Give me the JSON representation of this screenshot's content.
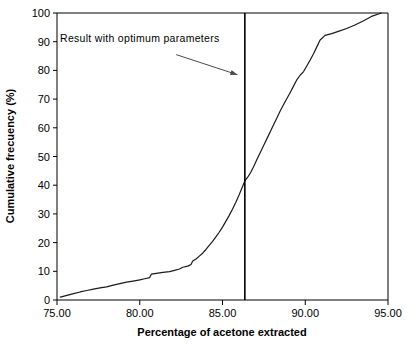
{
  "chart_data": {
    "type": "line",
    "title": "",
    "xlabel": "Percentage of acetone extracted",
    "ylabel": "Cumulative frecuency (%)",
    "xlim": [
      75.0,
      95.0
    ],
    "ylim": [
      0,
      100
    ],
    "xticks": [
      "75.00",
      "80.00",
      "85.00",
      "90.00",
      "95.00"
    ],
    "xtick_values": [
      75,
      80,
      85,
      90,
      95
    ],
    "yticks": [
      "0",
      "10",
      "20",
      "30",
      "40",
      "50",
      "60",
      "70",
      "80",
      "90",
      "100"
    ],
    "ytick_values": [
      0,
      10,
      20,
      30,
      40,
      50,
      60,
      70,
      80,
      90,
      100
    ],
    "grid": false,
    "legend": false,
    "series": [
      {
        "name": "Cumulative frequency curve",
        "x": [
          75.2,
          75.6,
          76.0,
          76.4,
          76.8,
          77.2,
          77.6,
          78.0,
          78.4,
          78.8,
          79.2,
          79.6,
          80.0,
          80.3,
          80.6,
          80.7,
          81.0,
          81.4,
          81.8,
          82.1,
          82.4,
          82.6,
          82.9,
          83.1,
          83.2,
          83.4,
          83.6,
          83.8,
          84.0,
          84.2,
          84.4,
          84.6,
          84.8,
          85.0,
          85.2,
          85.4,
          85.6,
          85.8,
          86.0,
          86.2,
          86.35,
          86.5,
          86.7,
          86.9,
          87.1,
          87.3,
          87.5,
          87.7,
          87.9,
          88.1,
          88.3,
          88.5,
          88.7,
          88.9,
          89.1,
          89.3,
          89.5,
          89.7,
          89.9,
          90.1,
          90.3,
          90.5,
          90.7,
          90.9,
          91.2,
          91.6,
          92.0,
          92.5,
          93.0,
          93.5,
          94.0,
          94.6
        ],
        "y": [
          1.0,
          1.6,
          2.2,
          2.8,
          3.3,
          3.8,
          4.2,
          4.6,
          5.2,
          5.7,
          6.2,
          6.6,
          7.0,
          7.4,
          7.8,
          9.0,
          9.3,
          9.6,
          9.9,
          10.3,
          10.8,
          11.4,
          11.8,
          12.4,
          13.6,
          14.3,
          15.3,
          16.3,
          17.6,
          19.0,
          20.4,
          22.0,
          23.6,
          25.4,
          27.4,
          29.4,
          31.6,
          34.0,
          36.6,
          39.4,
          41.5,
          42.6,
          44.4,
          46.7,
          49.2,
          51.6,
          54.0,
          56.4,
          58.8,
          61.2,
          63.6,
          66.0,
          68.2,
          70.3,
          72.4,
          74.6,
          76.8,
          78.4,
          79.6,
          81.6,
          83.6,
          85.8,
          88.2,
          90.6,
          92.2,
          92.8,
          93.6,
          94.6,
          95.8,
          97.2,
          98.8,
          100.0
        ]
      }
    ],
    "vertical_line": {
      "name": "optimum-parameters-line",
      "x": 86.35,
      "y_from": 0,
      "y_to": 100
    },
    "annotation": {
      "text": "Result with optimum parameters",
      "text_x": 78.0,
      "text_y": 94.0,
      "arrow_from_x": 82.2,
      "arrow_from_y": 85.5,
      "arrow_to_x": 85.9,
      "arrow_to_y": 78.5
    }
  },
  "colors": {
    "curve": "#1a1a1a",
    "vline": "#000000",
    "frame": "#000000",
    "arrow": "#4a4a4a",
    "background": "#ffffff"
  }
}
